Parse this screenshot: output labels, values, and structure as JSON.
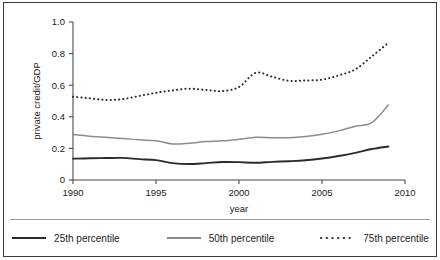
{
  "chart_data": {
    "type": "line",
    "title": "",
    "xlabel": "year",
    "ylabel": "private credit/GDP",
    "xlim": [
      1990,
      2010
    ],
    "ylim": [
      0,
      1.0
    ],
    "grid": false,
    "legend_position": "bottom",
    "x": [
      1990,
      1991,
      1992,
      1993,
      1994,
      1995,
      1996,
      1997,
      1998,
      1999,
      2000,
      2001,
      2002,
      2003,
      2004,
      2005,
      2006,
      2007,
      2008,
      2009
    ],
    "xticks": [
      1990,
      1995,
      2000,
      2005,
      2010
    ],
    "xtick_labels": [
      "1990",
      "1995",
      "2000",
      "2005",
      "2010"
    ],
    "yticks": [
      0,
      0.2,
      0.4,
      0.6,
      0.8,
      1.0
    ],
    "ytick_labels": [
      "0",
      "0.2",
      "0.4",
      "0.6",
      "0.8",
      "1.0"
    ],
    "series": [
      {
        "name": "25th percentile",
        "style": "solid",
        "color": "#2b2b2b",
        "values": [
          0.135,
          0.138,
          0.139,
          0.14,
          0.132,
          0.126,
          0.107,
          0.101,
          0.107,
          0.114,
          0.113,
          0.109,
          0.115,
          0.119,
          0.125,
          0.136,
          0.152,
          0.172,
          0.196,
          0.212
        ]
      },
      {
        "name": "50th percentile",
        "style": "solid",
        "color": "#8c8c8c",
        "values": [
          0.288,
          0.277,
          0.27,
          0.263,
          0.254,
          0.248,
          0.228,
          0.233,
          0.243,
          0.248,
          0.258,
          0.27,
          0.268,
          0.268,
          0.275,
          0.289,
          0.311,
          0.34,
          0.363,
          0.475
        ]
      },
      {
        "name": "75th percentile",
        "style": "dotted",
        "color": "#2b2b2b",
        "values": [
          0.527,
          0.517,
          0.507,
          0.512,
          0.532,
          0.552,
          0.567,
          0.578,
          0.57,
          0.563,
          0.588,
          0.678,
          0.653,
          0.628,
          0.63,
          0.635,
          0.662,
          0.7,
          0.782,
          0.868
        ]
      }
    ]
  },
  "legend": {
    "items": [
      {
        "label": "25th percentile",
        "style": "solid",
        "color": "#2b2b2b",
        "width": 2.2
      },
      {
        "label": "50th percentile",
        "style": "solid",
        "color": "#8c8c8c",
        "width": 1.8
      },
      {
        "label": "75th percentile",
        "style": "dotted",
        "color": "#2b2b2b",
        "width": 2.2
      }
    ]
  }
}
